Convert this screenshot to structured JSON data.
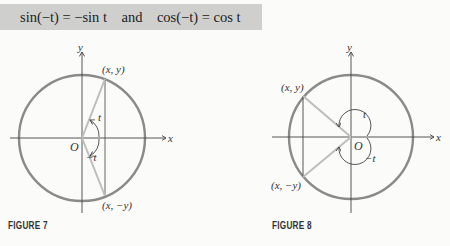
{
  "formula": {
    "text": "sin(−t) = −sin t    and    cos(−t) = cos t"
  },
  "figure7": {
    "caption": "FIGURE 7",
    "labels": {
      "y_axis": "y",
      "x_axis": "x",
      "origin": "O",
      "upper_point": "(x, y)",
      "lower_point": "(x, −y)",
      "angle_pos": "t",
      "angle_neg": "−t"
    }
  },
  "figure8": {
    "caption": "FIGURE 8",
    "labels": {
      "y_axis": "y",
      "x_axis": "x",
      "origin": "O",
      "upper_point": "(x, y)",
      "lower_point": "(x, −y)",
      "angle_pos": "t",
      "angle_neg": "−t"
    }
  },
  "colors": {
    "circle": "#8a8a8a",
    "radius": "#bdbdbd",
    "axis": "#444444",
    "box": "#cfcfcd"
  }
}
